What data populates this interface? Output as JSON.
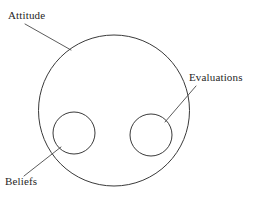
{
  "diagram": {
    "type": "venn-containment",
    "background_color": "#ffffff",
    "stroke_color": "#3a3a3a",
    "text_color": "#262626",
    "shapes": [
      {
        "id": "attitude-circle",
        "name": "Attitude",
        "role": "outer-container",
        "cx": 114,
        "cy": 110.5,
        "r": 75.5
      },
      {
        "id": "beliefs-circle",
        "name": "Beliefs",
        "role": "inner-circle-left",
        "cx": 74,
        "cy": 133,
        "r": 21
      },
      {
        "id": "evaluations-circle",
        "name": "Evaluations",
        "role": "inner-circle-right",
        "cx": 151,
        "cy": 135,
        "r": 21
      }
    ],
    "labels": [
      {
        "id": "attitude-label",
        "text": "Attitude",
        "x": 8,
        "y": 19,
        "anchor": "start",
        "target": "attitude-circle"
      },
      {
        "id": "evaluations-label",
        "text": "Evaluations",
        "x": 189,
        "y": 81,
        "anchor": "start",
        "target": "evaluations-circle"
      },
      {
        "id": "beliefs-label",
        "text": "Beliefs",
        "x": 5,
        "y": 185,
        "anchor": "start",
        "target": "beliefs-circle"
      }
    ],
    "leaders": [
      {
        "id": "attitude-leader",
        "from_label": "Attitude",
        "to_shape": "attitude-circle",
        "x1": 25,
        "y1": 24,
        "x2": 71,
        "y2": 50
      },
      {
        "id": "evaluations-leader",
        "from_label": "Evaluations",
        "to_shape": "evaluations-circle",
        "x1": 196,
        "y1": 86,
        "x2": 165,
        "y2": 122
      },
      {
        "id": "beliefs-leader",
        "from_label": "Beliefs",
        "to_shape": "beliefs-circle",
        "x1": 24,
        "y1": 176,
        "x2": 61,
        "y2": 147
      }
    ]
  }
}
